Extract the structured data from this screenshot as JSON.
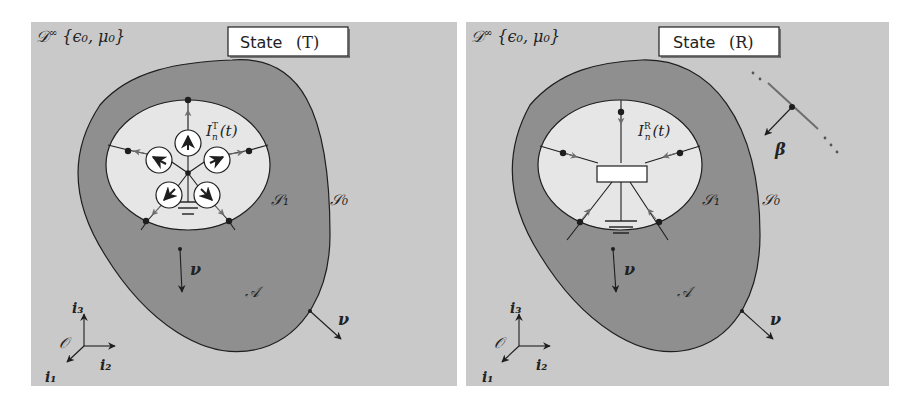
{
  "colors": {
    "background": "#c9c9c9",
    "body_fill": "#8f8f8f",
    "cavity_fill": "#e6e6e6",
    "stroke": "#1e1e1e",
    "arrow_grey": "#6e6e6e",
    "label_box": "#ffffff"
  },
  "panels": [
    {
      "id": "T",
      "state_label": {
        "prefix": "State",
        "value": "(T)"
      },
      "domain_label": {
        "symbol": "𝒟",
        "sup": "∞",
        "params": "{ϵ₀, μ₀}"
      },
      "current_label": {
        "symbol": "I",
        "sub": "n",
        "sup": "T",
        "arg": "(t)"
      },
      "surface_inner": "𝒮₁",
      "surface_outer": "𝒮₀",
      "region": "𝒜",
      "normal": "ν",
      "axes": {
        "origin": "𝒪",
        "i1": "i₁",
        "i2": "i₂",
        "i3": "i₃"
      },
      "source_type": "current-sources",
      "source_count": 5
    },
    {
      "id": "R",
      "state_label": {
        "prefix": "State",
        "value": "(R)"
      },
      "domain_label": {
        "symbol": "𝒟",
        "sup": "∞",
        "params": "{ϵ₀, μ₀}"
      },
      "current_label": {
        "symbol": "I",
        "sub": "n",
        "sup": "R",
        "arg": "(t)"
      },
      "surface_inner": "𝒮₁",
      "surface_outer": "𝒮₀",
      "region": "𝒜",
      "normal": "ν",
      "axes": {
        "origin": "𝒪",
        "i1": "i₁",
        "i2": "i₂",
        "i3": "i₃"
      },
      "source_type": "load-impedance",
      "incident_wave": "β"
    }
  ]
}
